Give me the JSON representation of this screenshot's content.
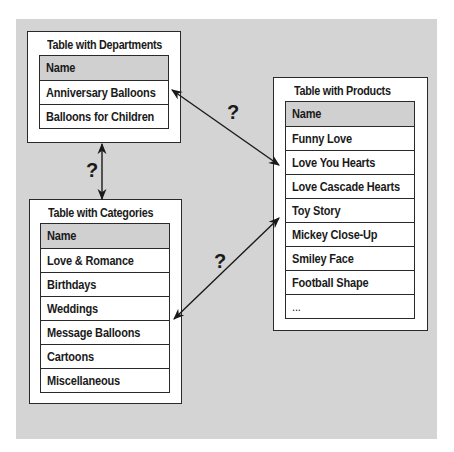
{
  "departments": {
    "title": "Table with Departments",
    "header": "Name",
    "rows": [
      "Anniversary Balloons",
      "Balloons for Children"
    ]
  },
  "categories": {
    "title": "Table with Categories",
    "header": "Name",
    "rows": [
      "Love & Romance",
      "Birthdays",
      "Weddings",
      "Message Balloons",
      "Cartoons",
      "Miscellaneous"
    ]
  },
  "products": {
    "title": "Table with Products",
    "header": "Name",
    "rows": [
      "Funny Love",
      "Love You Hearts",
      "Love Cascade Hearts",
      "Toy Story",
      "Mickey Close-Up",
      "Smiley Face",
      "Football Shape",
      "..."
    ]
  },
  "relations": {
    "dept_products_label": "?",
    "dept_categories_label": "?",
    "categories_products_label": "?"
  },
  "colors": {
    "background": "#d4d4d4",
    "header_fill": "#d0d0d0",
    "line": "#2a2a2a"
  }
}
